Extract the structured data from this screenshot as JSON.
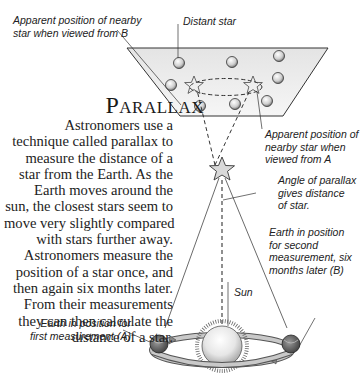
{
  "title": "Parallax",
  "body_lines": [
    "Astronomers use a",
    "technique called parallax to",
    "measure the distance of a",
    "star from the Earth. As the",
    "Earth moves around the",
    "sun, the closest stars seem to",
    "move very slightly compared",
    "with stars further away.",
    "Astronomers measure the",
    "position of a star once, and",
    "then again six months later.",
    "From their measurements",
    "they can then calculate the",
    "distance of a star."
  ],
  "labels": {
    "apparent_b": "Apparent position of nearby\nstar when viewed from B",
    "distant_star": "Distant star",
    "apparent_a": "Apparent position of\nnearby star when\nviewed from A",
    "angle": "Angle of parallax\ngives distance\nof star.",
    "earth_b": "Earth in position\nfor second\nmeasurement, six\nmonths later (B)",
    "sun": "Sun",
    "earth_a": "Earth in position for\nfirst measurement (A)"
  },
  "colors": {
    "panel_fill": "#efefef",
    "line": "#333333",
    "text": "#222222"
  }
}
